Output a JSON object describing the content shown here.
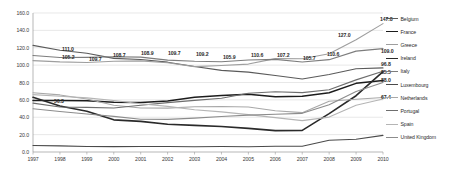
{
  "chart_data": {
    "type": "line",
    "title": "",
    "xlabel": "",
    "ylabel": "",
    "grid": true,
    "legend_position": "right",
    "xlim": [
      1997,
      2010
    ],
    "ylim": [
      0,
      160
    ],
    "ytick_step": 20,
    "x": [
      1997,
      1998,
      1999,
      2000,
      2001,
      2002,
      2003,
      2004,
      2005,
      2006,
      2007,
      2008,
      2009,
      2010
    ],
    "categories": [
      "1997",
      "1998",
      "1999",
      "2000",
      "2001",
      "2002",
      "2003",
      "2004",
      "2005",
      "2006",
      "2007",
      "2008",
      "2009",
      "2010"
    ],
    "ytick_labels": [
      "0.0",
      "20.0",
      "40.0",
      "60.0",
      "80.0",
      "100.0",
      "120.0",
      "140.0",
      "160.0"
    ],
    "series": [
      {
        "name": "Belgium",
        "color": "#5a5a5a",
        "width": 1.1,
        "values": [
          122.7,
          117.2,
          113.6,
          107.8,
          106.5,
          103.4,
          98.4,
          94.0,
          92.0,
          88.0,
          84.0,
          89.3,
          95.9,
          96.8
        ]
      },
      {
        "name": "France",
        "color": "#1c1c1c",
        "width": 1.5,
        "values": [
          59.2,
          59.4,
          58.9,
          57.3,
          56.9,
          58.8,
          62.9,
          64.9,
          66.4,
          63.7,
          64.2,
          68.2,
          79.0,
          82.3
        ]
      },
      {
        "name": "Greece",
        "color": "#9e9e9e",
        "width": 1.1,
        "values": [
          105.2,
          103.7,
          103.0,
          104.4,
          104.9,
          102.7,
          98.3,
          99.6,
          101.2,
          107.5,
          107.4,
          113.0,
          129.3,
          147.8
        ]
      },
      {
        "name": "Ireland",
        "color": "#2a2a2a",
        "width": 1.6,
        "values": [
          63.0,
          53.0,
          47.0,
          37.0,
          35.2,
          31.9,
          30.7,
          29.4,
          27.2,
          24.6,
          24.9,
          44.2,
          64.8,
          92.5
        ]
      },
      {
        "name": "Italy",
        "color": "#7d7d7d",
        "width": 1.1,
        "values": [
          111.0,
          108.7,
          108.9,
          109.7,
          109.2,
          105.7,
          104.4,
          103.9,
          105.9,
          106.6,
          103.6,
          106.3,
          116.1,
          119.0
        ]
      },
      {
        "name": "Luxembourg",
        "color": "#4a4a4a",
        "width": 1.1,
        "values": [
          7.4,
          7.1,
          6.4,
          6.2,
          6.3,
          6.3,
          6.1,
          6.3,
          6.1,
          6.7,
          6.7,
          13.6,
          14.6,
          19.1
        ]
      },
      {
        "name": "Netherlands",
        "color": "#a8a8a8",
        "width": 1.1,
        "values": [
          68.2,
          65.7,
          61.1,
          53.8,
          50.7,
          50.5,
          52.0,
          52.4,
          51.8,
          47.4,
          45.3,
          58.5,
          60.8,
          62.7
        ]
      },
      {
        "name": "Portugal",
        "color": "#6e6e6e",
        "width": 1.1,
        "values": [
          56.3,
          51.8,
          51.4,
          50.7,
          53.8,
          56.8,
          59.4,
          61.9,
          67.7,
          69.3,
          68.3,
          71.6,
          83.0,
          93.0
        ]
      },
      {
        "name": "Spain",
        "color": "#b5b5b5",
        "width": 1.1,
        "values": [
          66.1,
          64.1,
          62.3,
          59.3,
          55.5,
          52.5,
          48.7,
          46.2,
          43.0,
          39.6,
          36.1,
          40.2,
          53.9,
          61.0
        ]
      },
      {
        "name": "United Kingdom",
        "color": "#8c8c8c",
        "width": 1.1,
        "values": [
          49.8,
          46.7,
          43.7,
          41.0,
          37.7,
          37.5,
          39.0,
          40.9,
          42.5,
          43.4,
          44.5,
          54.4,
          69.6,
          79.9
        ]
      }
    ],
    "point_labels": [
      {
        "text": "111.0",
        "x": 62,
        "y": 46
      },
      {
        "text": "105.2",
        "x": 62,
        "y": 54
      },
      {
        "text": "109.7",
        "x": 89,
        "y": 56
      },
      {
        "text": "108.7",
        "x": 113,
        "y": 52
      },
      {
        "text": "108.9",
        "x": 141,
        "y": 50
      },
      {
        "text": "109.7",
        "x": 168,
        "y": 50
      },
      {
        "text": "109.2",
        "x": 196,
        "y": 51
      },
      {
        "text": "105.9",
        "x": 223,
        "y": 54
      },
      {
        "text": "110.6",
        "x": 251,
        "y": 52
      },
      {
        "text": "107.2",
        "x": 277,
        "y": 52
      },
      {
        "text": "105.7",
        "x": 303,
        "y": 55
      },
      {
        "text": "110.6",
        "x": 327,
        "y": 51
      },
      {
        "text": "127.0",
        "x": 338,
        "y": 32
      },
      {
        "text": "147.8",
        "x": 380,
        "y": 16
      },
      {
        "text": "109.0",
        "x": 381,
        "y": 48
      },
      {
        "text": "96.8",
        "x": 381,
        "y": 61
      },
      {
        "text": "85.5",
        "x": 381,
        "y": 69
      },
      {
        "text": "88.0",
        "x": 381,
        "y": 77
      },
      {
        "text": "67.4",
        "x": 381,
        "y": 94
      },
      {
        "text": "56.3",
        "x": 54,
        "y": 98
      }
    ]
  }
}
